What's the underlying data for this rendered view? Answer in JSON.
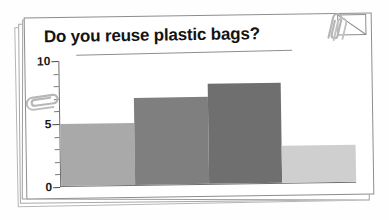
{
  "document": {
    "title": "Do you reuse plastic bags?",
    "sheet_count": 4
  },
  "decorations": {
    "paperclip_top_right": "paperclip-icon",
    "paperclip_left": "paperclip-icon",
    "folded_corner": "dog-ear-icon"
  },
  "axis": {
    "y_labels": [
      "0",
      "5",
      "10"
    ],
    "x_labels": [
      "always",
      "usually",
      "sometimes",
      "never"
    ]
  },
  "colors": {
    "bar_always": "#a9a9a9",
    "bar_usually": "#7f7f7f",
    "bar_sometimes": "#6f6f6f",
    "bar_never": "#cfcfcf",
    "axis": "#6e6e6e",
    "paper": "#ffffff",
    "paper_edge": "#8d8d8d",
    "title_text": "#131313"
  },
  "chart_data": {
    "type": "bar",
    "title": "Do you reuse plastic bags?",
    "categories": [
      "always",
      "usually",
      "sometimes",
      "never"
    ],
    "values": [
      5,
      7,
      8,
      3
    ],
    "colors": [
      "#a9a9a9",
      "#7f7f7f",
      "#6f6f6f",
      "#cfcfcf"
    ],
    "xlabel": "",
    "ylabel": "",
    "ylim": [
      0,
      10
    ],
    "ytick_major": [
      0,
      5,
      10
    ],
    "ytick_minor_step": 1,
    "grid": false,
    "legend": false
  }
}
